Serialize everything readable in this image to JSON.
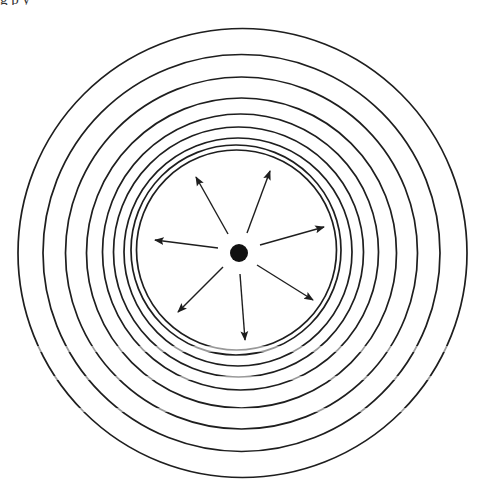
{
  "caption": "g      p      y",
  "diagram": {
    "type": "concentric-wave-fronts",
    "colors": {
      "line": "#1e1e1e",
      "source": "#111111",
      "background": "#ffffff"
    },
    "source": {
      "cx": 239,
      "cy": 253,
      "r": 9
    },
    "rings": [
      {
        "cx": 242.5,
        "cy": 253,
        "r": 224.5
      },
      {
        "cx": 241.5,
        "cy": 253,
        "r": 198.5
      },
      {
        "cx": 241.5,
        "cy": 253,
        "r": 176
      },
      {
        "cx": 241.5,
        "cy": 253,
        "r": 155
      },
      {
        "cx": 240.5,
        "cy": 252,
        "r": 138
      },
      {
        "cx": 238.5,
        "cy": 252,
        "r": 125
      },
      {
        "cx": 238,
        "cy": 252,
        "r": 114
      },
      {
        "cx": 236,
        "cy": 250,
        "r": 105
      },
      {
        "cx": 236.5,
        "cy": 250,
        "r": 100
      }
    ],
    "arrows": [
      {
        "name": "up-left",
        "x1": 228,
        "y1": 234,
        "x2": 196,
        "y2": 177
      },
      {
        "name": "up-right",
        "x1": 247,
        "y1": 233,
        "x2": 270,
        "y2": 171
      },
      {
        "name": "left",
        "x1": 218,
        "y1": 248,
        "x2": 155,
        "y2": 240
      },
      {
        "name": "right",
        "x1": 260,
        "y1": 245,
        "x2": 324,
        "y2": 227
      },
      {
        "name": "down-left",
        "x1": 223,
        "y1": 267,
        "x2": 178,
        "y2": 312
      },
      {
        "name": "down",
        "x1": 240,
        "y1": 274,
        "x2": 245,
        "y2": 340
      },
      {
        "name": "down-right",
        "x1": 257,
        "y1": 265,
        "x2": 313,
        "y2": 300
      }
    ]
  }
}
